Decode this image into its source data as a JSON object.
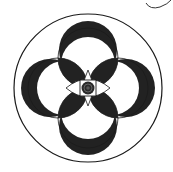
{
  "figure": {
    "colors": {
      "background": "#ffffff",
      "ink": "#1a1a1a",
      "fill": "#222222",
      "pupil": "#555555"
    },
    "elements": {
      "outer_ring": "outer-circle",
      "petals": [
        "top",
        "right",
        "bottom",
        "left"
      ],
      "center": "eye-with-square-and-pupil",
      "stray_mark": "pen-stroke-top-right"
    }
  }
}
